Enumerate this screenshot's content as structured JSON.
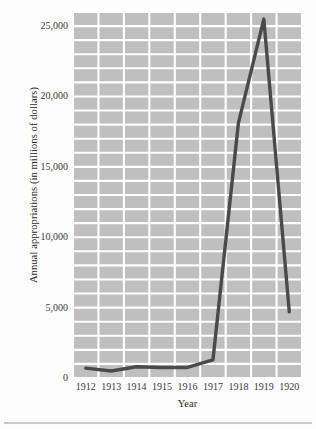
{
  "chart_data": {
    "type": "line",
    "title": "",
    "xlabel": "Year",
    "ylabel": "Annual appropriations (in millions of dollars)",
    "x": [
      1912,
      1913,
      1914,
      1915,
      1916,
      1917,
      1918,
      1919,
      1920
    ],
    "categories": [
      "1912",
      "1913",
      "1914",
      "1915",
      "1916",
      "1917",
      "1918",
      "1919",
      "1920"
    ],
    "values": [
      700,
      500,
      800,
      750,
      750,
      1280,
      18100,
      25500,
      4700
    ],
    "series": [
      {
        "name": "Annual appropriations",
        "values": [
          700,
          500,
          800,
          750,
          750,
          1280,
          18100,
          25500,
          4700
        ]
      }
    ],
    "ylim": [
      0,
      26000
    ],
    "xlim": [
      1912,
      1920
    ],
    "ytick_values": [
      0,
      5000,
      10000,
      15000,
      20000,
      25000
    ],
    "ytick_labels": [
      "0",
      "5,000",
      "10,000",
      "15,000",
      "20,000",
      "25,000"
    ],
    "xtick_labels": [
      "1912",
      "1913",
      "1914",
      "1915",
      "1916",
      "1917",
      "1918",
      "1919",
      "1920"
    ],
    "grid": true,
    "grid_minor_step": 1000,
    "legend": "none",
    "plot_background_color": "#bfbfbf",
    "grid_color": "#ffffff",
    "line_color": "#4a4a4a"
  },
  "axes": {
    "y_title": "Annual appropriations (in millions of dollars)",
    "x_title": "Year"
  }
}
